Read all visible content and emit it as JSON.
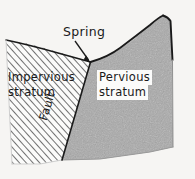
{
  "figure": {
    "type": "geological-block-diagram",
    "background_color": "#f6f5f3",
    "width": 195,
    "height": 179,
    "labels": {
      "spring": "Spring",
      "impervious_line1": "Impervious",
      "impervious_line2": "stratum",
      "pervious_line1": "Pervious",
      "pervious_line2": "stratum",
      "fault": "Fault"
    },
    "colors": {
      "outline": "#1a1a1a",
      "pervious_fill": "#a8a8a8",
      "impervious_hatch": "#4a4a4a",
      "impervious_base": "#fbfbfa",
      "label_box": "#fbfbfa",
      "text": "#1a1a1a"
    },
    "annotations": {
      "spring_arrow": "arrow pointing down-right to the spring outflow point at the top of the fault"
    }
  }
}
